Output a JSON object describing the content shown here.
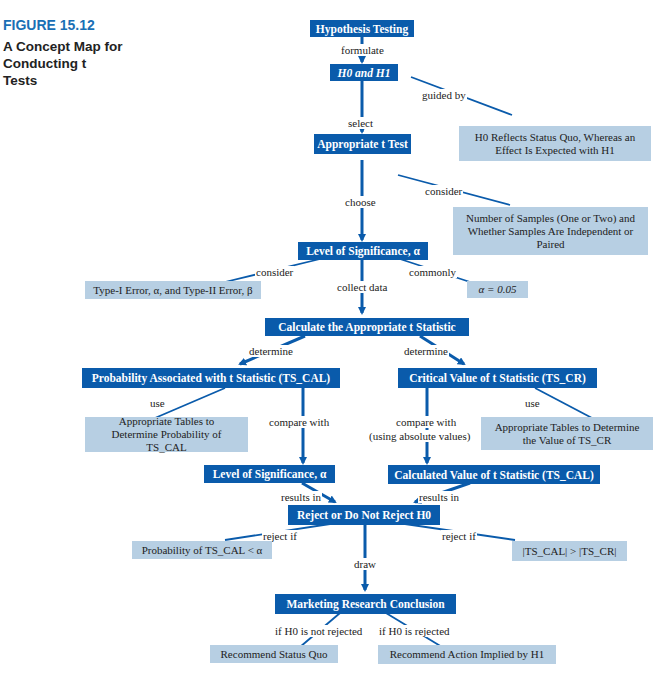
{
  "caption": {
    "figure_number": "FIGURE 15.12",
    "title": "A Concept Map for Conducting t Tests"
  },
  "nodes": {
    "hypothesis_testing": "Hypothesis Testing",
    "h0_h1": "H0 and H1",
    "appropriate_t_test": "Appropriate t Test",
    "level_of_significance": "Level of Significance, α",
    "calculate_statistic": "Calculate the Appropriate t Statistic",
    "probability_associated": "Probability Associated with t Statistic (TS_CAL)",
    "critical_value": "Critical Value of t Statistic (TS_CR)",
    "level_of_significance_2": "Level of Significance, α",
    "calculated_value": "Calculated Value of t Statistic (TS_CAL)",
    "reject_decision": "Reject or Do Not Reject H0",
    "marketing_conclusion": "Marketing Research Conclusion"
  },
  "notes": {
    "status_quo_effect": "H0 Reflects Status Quo, Whereas an Effect Is Expected with H1",
    "number_of_samples": "Number of Samples (One or Two) and Whether Samples Are Independent or Paired",
    "type_errors": "Type-I Error, α, and Type-II Error, β",
    "alpha_value": "α = 0.05",
    "tables_probability": "Appropriate Tables to Determine Probability of TS_CAL",
    "tables_value": "Appropriate Tables to Determine the Value of TS_CR",
    "probability_less_alpha": "Probability of TS_CAL < α",
    "abs_comparison": "|TS_CAL| > |TS_CR|",
    "recommend_status_quo": "Recommend Status Quo",
    "recommend_action": "Recommend Action Implied by H1"
  },
  "edge_labels": {
    "formulate": "formulate",
    "guided_by": "guided by",
    "select": "select",
    "consider_1": "consider",
    "choose": "choose",
    "consider_2": "consider",
    "commonly": "commonly",
    "collect_data": "collect data",
    "determine_left": "determine",
    "determine_right": "determine",
    "use_left": "use",
    "compare_with": "compare with",
    "use_right": "use",
    "compare_with_abs_1": "compare with",
    "compare_with_abs_2": "(using absolute values)",
    "results_in_left": "results in",
    "results_in_right": "results in",
    "reject_if_left": "reject if",
    "draw": "draw",
    "reject_if_right": "reject if",
    "if_not_rejected": "if H0 is not rejected",
    "if_rejected": "if H0 is rejected"
  },
  "colors": {
    "node_fill": "#0a5bab",
    "note_fill": "#b7cfe3",
    "caption_accent": "#1a6fb5",
    "connector": "#0a5bab"
  }
}
